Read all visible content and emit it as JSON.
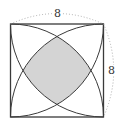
{
  "diagram": {
    "type": "geometry",
    "square": {
      "side_length": 8
    },
    "labels": {
      "top_side": "8",
      "right_side": "8"
    },
    "colors": {
      "stroke": "#3a3a3a",
      "shaded_fill": "#d4d4d4",
      "dimension_dotted": "#9a9a9a",
      "background": "#ffffff"
    }
  }
}
